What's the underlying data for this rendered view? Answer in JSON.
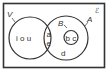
{
  "diagram": {
    "type": "venn",
    "universal_set_label": "ℰ",
    "sets": [
      {
        "name": "V",
        "label": "V"
      },
      {
        "name": "A",
        "label": "A"
      },
      {
        "name": "B",
        "label": "B"
      }
    ],
    "regions": {
      "v_only": "i o u",
      "v_and_a_top": "a",
      "v_and_a_bottom": "e",
      "b_inside_a": "b c",
      "a_only": "d"
    },
    "colors": {
      "stroke": "#333333",
      "background": "#ffffff"
    }
  }
}
